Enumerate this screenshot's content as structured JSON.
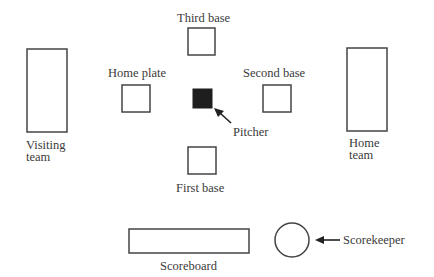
{
  "diagram": {
    "type": "game setup layout",
    "colors": {
      "outline": "#444444",
      "pitcher_fill": "#1e1e1e",
      "text": "#3a3a3a",
      "background": "#ffffff"
    },
    "labels": {
      "third_base": "Third base",
      "home_plate": "Home plate",
      "second_base": "Second base",
      "pitcher": "Pitcher",
      "first_base": "First base",
      "visiting_team_line1": "Visiting",
      "visiting_team_line2": "team",
      "home_team_line1": "Home",
      "home_team_line2": "team",
      "scoreboard": "Scoreboard",
      "scorekeeper": "Scorekeeper"
    },
    "elements": [
      {
        "id": "visiting-team",
        "shape": "rectangle"
      },
      {
        "id": "home-team",
        "shape": "rectangle"
      },
      {
        "id": "third-base",
        "shape": "square"
      },
      {
        "id": "home-plate",
        "shape": "square"
      },
      {
        "id": "pitcher",
        "shape": "filled-square"
      },
      {
        "id": "second-base",
        "shape": "square"
      },
      {
        "id": "first-base",
        "shape": "square"
      },
      {
        "id": "scoreboard",
        "shape": "rectangle"
      },
      {
        "id": "scorekeeper",
        "shape": "circle"
      }
    ],
    "arrows": [
      {
        "from": "Pitcher label",
        "to": "pitcher"
      },
      {
        "from": "Scorekeeper label",
        "to": "scorekeeper"
      }
    ]
  }
}
